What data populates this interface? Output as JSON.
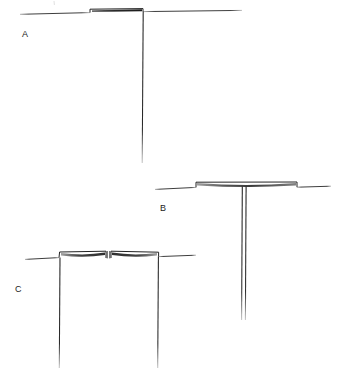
{
  "figure": {
    "width": 340,
    "height": 382,
    "background_color": "#ffffff",
    "ink_color": "#1f1f1f",
    "faint_ink_color": "#8a8a8a",
    "panels": [
      {
        "id": "panel-a",
        "label": "A",
        "label_x": 22,
        "label_y": 30,
        "description": "Horizontal substrate line with a single raised block at the left-of-center and one long vertical line descending from the right edge of the block.",
        "baseline": {
          "x1": 20,
          "y1": 14,
          "x2": 242,
          "y2": 11
        },
        "raised_block": {
          "x1": 90,
          "y1": 9,
          "x2": 143,
          "y2": 9,
          "drop": 5
        },
        "verticals": [
          {
            "x": 143,
            "y1": 11,
            "y2": 163
          }
        ]
      },
      {
        "id": "panel-b",
        "label": "B",
        "label_x": 160,
        "label_y": 204,
        "description": "Horizontal substrate line with a wide raised block spanning the centre and a single narrow double-walled vertical channel descending from the midpoint.",
        "baseline": {
          "x1": 155,
          "y1": 189,
          "x2": 331,
          "y2": 186
        },
        "raised_block": {
          "x1": 196,
          "y1": 182,
          "x2": 297,
          "y2": 182,
          "drop": 6
        },
        "verticals": [
          {
            "x": 242,
            "y1": 187,
            "y2": 320
          },
          {
            "x": 246,
            "y1": 187,
            "y2": 320
          }
        ]
      },
      {
        "id": "panel-c",
        "label": "C",
        "label_x": 15,
        "label_y": 285,
        "description": "Horizontal substrate line with two raised blocks separated by a narrow central notch, and two long vertical lines descending from the outer edges.",
        "baseline": {
          "x1": 25,
          "y1": 259,
          "x2": 196,
          "y2": 255
        },
        "raised_block_left": {
          "x1": 59,
          "y1": 254,
          "x2": 106,
          "y2": 252,
          "drop": 6
        },
        "raised_block_right": {
          "x1": 111,
          "y1": 252,
          "x2": 159,
          "y2": 254,
          "drop": 6
        },
        "notch": {
          "x1": 106,
          "x2": 111,
          "y1": 251,
          "y2": 259
        },
        "verticals": [
          {
            "x": 60,
            "y1": 259,
            "y2": 368
          },
          {
            "x": 158,
            "y1": 259,
            "y2": 368
          }
        ]
      }
    ]
  }
}
